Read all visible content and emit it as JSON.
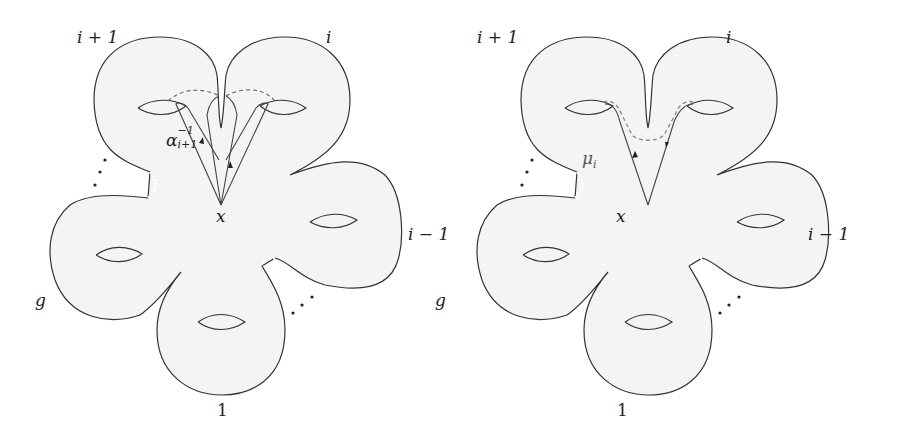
{
  "figures": [
    {
      "id": "left",
      "handle_labels": {
        "top_left": "i + 1",
        "top_right": "i",
        "right": "i − 1",
        "left": "g",
        "bottom": "1"
      },
      "basepoint_label": "x",
      "loop_label": {
        "symbol": "α",
        "superscript": "−1",
        "subscript": "i+1"
      },
      "ellipsis": "⋮"
    },
    {
      "id": "right",
      "handle_labels": {
        "top_left": "i + 1",
        "top_right": "i",
        "right": "i − 1",
        "left": "g",
        "bottom": "1"
      },
      "basepoint_label": "x",
      "loop_label": {
        "symbol": "μ",
        "subscript": "i"
      },
      "ellipsis": "⋮"
    }
  ],
  "colors": {
    "surface_fill": "#f4f4f4",
    "outline": "#333333",
    "path": "#555555",
    "dashed": "#888888"
  }
}
